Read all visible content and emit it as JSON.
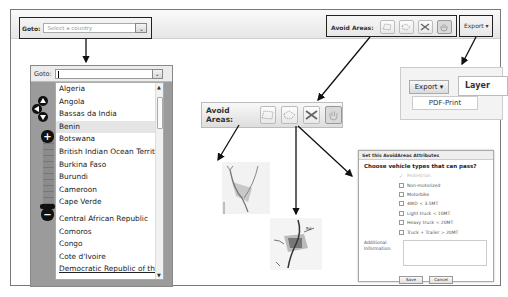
{
  "toolbar": {
    "goto_label": "Goto:",
    "goto_placeholder": "Select a country",
    "avoid_areas_label": "Avoid Areas:",
    "export_label": "Export ▾",
    "tools": [
      {
        "name": "draw-polygon-icon"
      },
      {
        "name": "draw-freeform-icon"
      },
      {
        "name": "delete-area-icon"
      },
      {
        "name": "pan-hand-icon"
      }
    ]
  },
  "country_dropdown": {
    "goto_label": "Goto:",
    "input_value": "",
    "selected": "Benin",
    "items": [
      "Algeria",
      "Angola",
      "Bassas da India",
      "Benin",
      "Botswana",
      "British Indian Ocean Territc",
      "Burkina Faso",
      "Burundi",
      "Cameroon",
      "Cape Verde",
      "Central African Republic",
      "Comoros",
      "Congo",
      "Cote d'Ivoire",
      "Democratic Republic of the"
    ]
  },
  "avoid_areas_zoomed": {
    "label": "Avoid Areas:"
  },
  "export_menu": {
    "button_label": "Export ▾",
    "tab_label": "Layer",
    "items": [
      "PDF-Print"
    ]
  },
  "avoid_dialog": {
    "title": "Set this AvoidAreas Attributes",
    "question": "Choose vehicle types that can pass?",
    "options": [
      {
        "label": "Pedestrian",
        "disabled": true
      },
      {
        "label": "Non-motorized",
        "disabled": false
      },
      {
        "label": "Motorbike",
        "disabled": false
      },
      {
        "label": "4WD < 3.5MT",
        "disabled": false
      },
      {
        "label": "Light truck < 10MT",
        "disabled": false
      },
      {
        "label": "Heavy truck < 20MT",
        "disabled": false
      },
      {
        "label": "Truck + Trailer > 20MT",
        "disabled": false
      }
    ],
    "additional_label": "Additional Information:",
    "save_label": "Save",
    "cancel_label": "Cancel"
  }
}
